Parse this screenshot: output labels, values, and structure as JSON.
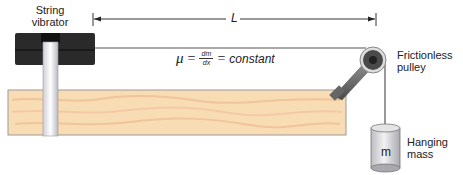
{
  "diagram": {
    "labels": {
      "vibrator_line1": "String",
      "vibrator_line2": "vibrator",
      "length": "L",
      "pulley_line1": "Frictionless",
      "pulley_line2": "pulley",
      "mass_line1": "Hanging",
      "mass_line2": "mass",
      "mass_symbol": "m"
    },
    "formula": {
      "lhs": "μ",
      "eq1": "=",
      "num": "dm",
      "den": "dx",
      "eq2": "=",
      "rhs": "constant"
    },
    "colors": {
      "board": "#f8dcb4",
      "board_grain": "#f1c49a",
      "vibrator": "#2a2a2a",
      "rod": "#e8e8ec",
      "string": "#555555",
      "pulley": "#4a4a4a",
      "mass": "#d9d9dc"
    }
  }
}
